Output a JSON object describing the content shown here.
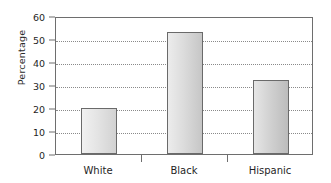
{
  "chart_data": {
    "type": "bar",
    "title": "",
    "xlabel": "",
    "ylabel": "Percentage",
    "categories": [
      "White",
      "Black",
      "Hispanic"
    ],
    "values": [
      20,
      53,
      32
    ],
    "ylim": [
      0,
      60
    ],
    "ytick_values": [
      0,
      10,
      20,
      30,
      40,
      50,
      60
    ],
    "ytick_labels": [
      "0",
      "10",
      "20",
      "30",
      "40",
      "50",
      "60"
    ],
    "ystep": 10,
    "grid": "horizontal-dotted",
    "gridline_values": [
      10,
      20,
      30,
      40,
      50
    ],
    "legend": "none",
    "bar_colors": [
      "#e4e4e4",
      "#dcdcdc",
      "#d2d2d2"
    ],
    "bar_border_color": "#6a6a6a",
    "frame_color": "#6e6e6e",
    "grid_color": "#8a8a8a",
    "background": "#ffffff",
    "text_color": "#1f1f1f"
  }
}
